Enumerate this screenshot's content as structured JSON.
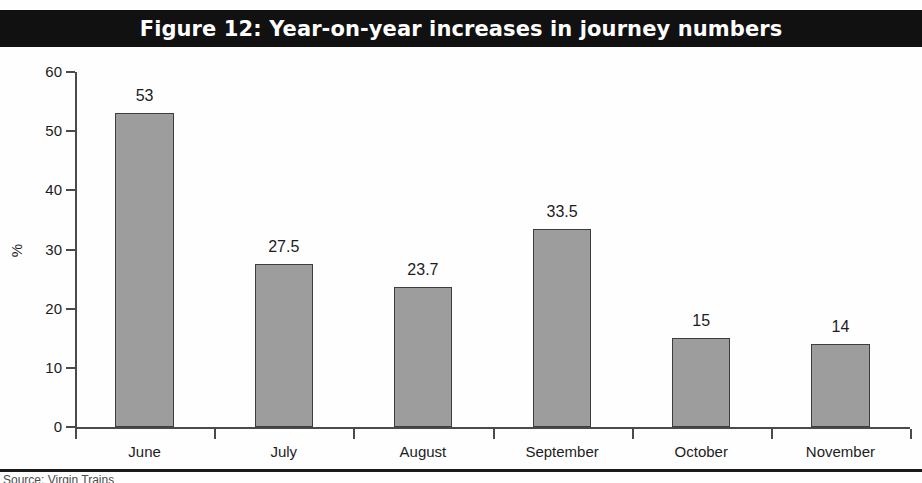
{
  "figure": {
    "title": "Figure 12: Year-on-year increases in journey numbers",
    "source_note": "Source: Virgin Trains",
    "title_bg_color": "#111111",
    "title_text_color": "#ffffff",
    "bar_fill_color": "#9d9d9d",
    "bar_border_color": "#3d3d3d",
    "axis_color": "#4a4a4a"
  },
  "chart_data": {
    "type": "bar",
    "title": "Figure 12: Year-on-year increases in journey numbers",
    "subtitle": "",
    "xlabel": "",
    "ylabel": "%",
    "categories": [
      "June",
      "July",
      "August",
      "September",
      "October",
      "November"
    ],
    "values": [
      53,
      27.5,
      23.7,
      33.5,
      15,
      14
    ],
    "value_labels": [
      "53",
      "27.5",
      "23.7",
      "33.5",
      "15",
      "14"
    ],
    "ylim": [
      0,
      60
    ],
    "yticks": [
      0,
      10,
      20,
      30,
      40,
      50,
      60
    ],
    "ytick_labels": [
      "0",
      "10",
      "20",
      "30",
      "40",
      "50",
      "60"
    ],
    "grid": false,
    "legend": false,
    "legend_position": "none",
    "series": [
      {
        "name": "Year-on-year increase",
        "values": [
          53,
          27.5,
          23.7,
          33.5,
          15,
          14
        ]
      }
    ]
  }
}
